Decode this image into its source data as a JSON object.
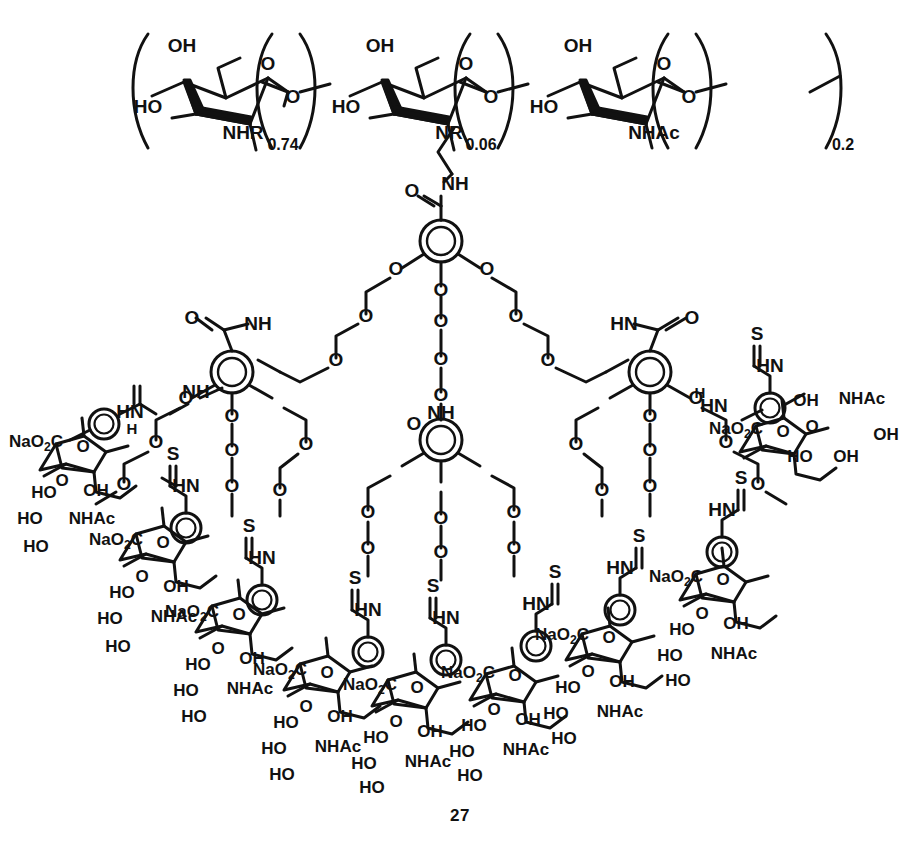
{
  "page": {
    "running_head_left": "",
    "running_head_right": "",
    "compound_number": "27"
  },
  "figure": {
    "kind": "chemical-structure",
    "backbone": {
      "name": "chitosan polymer backbone",
      "repeat_units": [
        {
          "id": "unit-nhr",
          "substituent": "NHR",
          "subscript": "0.74"
        },
        {
          "id": "unit-nr",
          "substituent": "NR",
          "subscript": "0.06"
        },
        {
          "id": "unit-nhac",
          "substituent": "NHAc",
          "subscript": "0.2"
        }
      ],
      "ring_labels": [
        "OH",
        "O",
        "HO"
      ],
      "glycosidic_label": "O"
    },
    "core": {
      "name": "gallamide dendron core",
      "amide_carbonyl": "O",
      "amide_nh": "NH",
      "ether_oxygens": [
        "O",
        "O",
        "O"
      ],
      "arm_count": 3
    },
    "branch": {
      "name": "second generation gallamide branch",
      "amide_carbonyl": "O",
      "amide_nh_left": "NH",
      "amide_nh_right": "HN",
      "ether_oxygen": "O",
      "count": 3
    },
    "linker": {
      "name": "triethylene glycol thiourea linker",
      "ether_oxygen": "O",
      "thiocarbonyl": "S",
      "nh_alkyl": "N",
      "nh_alkyl_h": "H",
      "nh_aryl": "HN",
      "nh_label_alt": "NH"
    },
    "terminal": {
      "name": "sodium sialate (Neu5Ac) terminal residue",
      "count": 9,
      "labels": {
        "carboxylate": "NaO₂C",
        "ring_oxygen": "O",
        "aryl_oxygen": "O",
        "hydroxyl": "OH",
        "hydroxyl_left": "HO",
        "acetamido": "NHAc"
      }
    },
    "atom_labels": [
      "OH",
      "HO",
      "O",
      "S",
      "N",
      "H",
      "NH",
      "HN",
      "NHR",
      "NR",
      "NHAc",
      "NaO₂C"
    ],
    "stoichiometry_labels": [
      "0.74",
      "0.06",
      "0.2"
    ]
  },
  "colors": {
    "ink": "#111111",
    "paper": "#ffffff"
  }
}
